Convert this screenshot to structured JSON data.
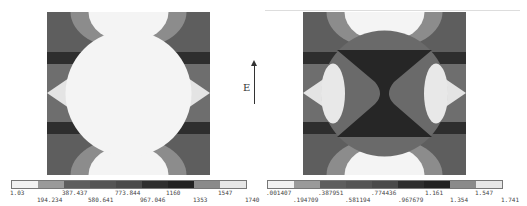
{
  "figure": {
    "field_label": "E",
    "colors": [
      "#f2f2f2",
      "#9a9a9a",
      "#707070",
      "#5c5c5c",
      "#4e4e4e",
      "#3a3a3a",
      "#2a2a2a",
      "#8a8a8a",
      "#e6e6e6"
    ],
    "left_plot": {
      "legend_labels_top": [
        "1.03",
        "387.437",
        "773.844",
        "1160",
        "1547"
      ],
      "legend_labels_bottom": [
        "194.234",
        "580.641",
        "967.046",
        "1353",
        "1740"
      ]
    },
    "right_plot": {
      "legend_labels_top": [
        ".001407",
        ".387951",
        ".774436",
        "1.161",
        "1.547"
      ],
      "legend_labels_bottom": [
        ".194709",
        ".581194",
        ".967679",
        "1.354",
        "1.741"
      ]
    }
  }
}
